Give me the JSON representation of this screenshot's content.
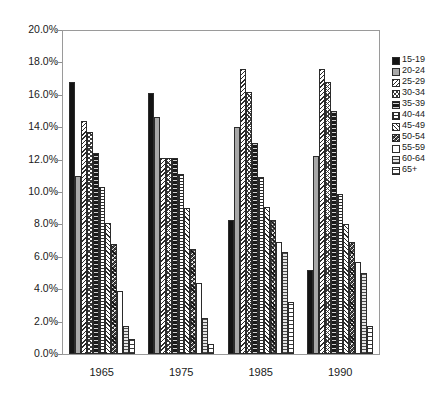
{
  "chart_data": {
    "type": "bar",
    "title": "",
    "xlabel": "",
    "ylabel": "",
    "categories": [
      "1965",
      "1975",
      "1985",
      "1990"
    ],
    "ylim": [
      0,
      20
    ],
    "ytick_labels": [
      "0.0%",
      "2.0%",
      "4.0%",
      "6.0%",
      "8.0%",
      "10.0%",
      "12.0%",
      "14.0%",
      "16.0%",
      "18.0%",
      "20.0%"
    ],
    "ytick_values": [
      0,
      2,
      4,
      6,
      8,
      10,
      12,
      14,
      16,
      18,
      20
    ],
    "grid": false,
    "legend_position": "right",
    "series": [
      {
        "name": "15-19",
        "pattern": "solid-black",
        "values": [
          16.8,
          16.1,
          8.3,
          5.2
        ]
      },
      {
        "name": "20-24",
        "pattern": "solid-gray",
        "values": [
          11.0,
          14.6,
          14.0,
          12.2
        ]
      },
      {
        "name": "25-29",
        "pattern": "diagonal-hatch",
        "values": [
          14.4,
          12.1,
          17.6,
          17.6
        ]
      },
      {
        "name": "30-34",
        "pattern": "crosshatch-dots",
        "values": [
          13.7,
          12.1,
          16.2,
          16.8
        ]
      },
      {
        "name": "35-39",
        "pattern": "black-dotted",
        "values": [
          12.4,
          12.1,
          13.0,
          15.0
        ]
      },
      {
        "name": "40-44",
        "pattern": "wave-hatch",
        "values": [
          10.3,
          11.1,
          10.9,
          9.9
        ]
      },
      {
        "name": "45-49",
        "pattern": "light-diagonal",
        "values": [
          8.1,
          9.0,
          9.1,
          8.0
        ]
      },
      {
        "name": "50-54",
        "pattern": "dense-crosshatch",
        "values": [
          6.8,
          6.5,
          8.3,
          6.9
        ]
      },
      {
        "name": "55-59",
        "pattern": "white-open",
        "values": [
          3.9,
          4.4,
          6.9,
          5.7
        ]
      },
      {
        "name": "60-64",
        "pattern": "horizontal-lines",
        "values": [
          1.7,
          2.2,
          6.3,
          5.0
        ]
      },
      {
        "name": "65+",
        "pattern": "sparse-horizontal",
        "values": [
          0.9,
          0.6,
          3.2,
          1.7
        ]
      }
    ]
  },
  "legend": {
    "entries": [
      "15-19",
      "20-24",
      "25-29",
      "30-34",
      "35-39",
      "40-44",
      "45-49",
      "50-54",
      "55-59",
      "60-64",
      "65+"
    ]
  }
}
